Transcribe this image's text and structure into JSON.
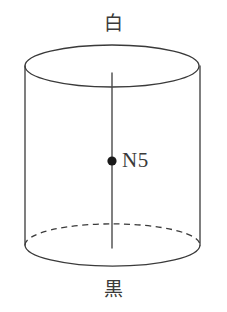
{
  "figure": {
    "background_color": "#ffffff",
    "stroke_color": "#3a3a3a",
    "width": 227,
    "height": 312
  },
  "labels": {
    "top": "白",
    "bottom": "黒",
    "center_point": "N5"
  },
  "geometry": {
    "top_ellipse": {
      "cx": 112,
      "cy": 66,
      "rx": 87,
      "ry": 21,
      "style": "solid"
    },
    "bottom_ellipse": {
      "cx": 112,
      "cy": 245,
      "rx": 87,
      "ry": 21,
      "front_style": "solid",
      "back_style": "dashed"
    },
    "left_side": {
      "x": 25,
      "y1": 66,
      "y2": 245
    },
    "right_side": {
      "x": 200,
      "y1": 66,
      "y2": 245
    },
    "axis_line": {
      "x": 112,
      "y1": 73,
      "y2": 248
    },
    "center_dot": {
      "cx": 112,
      "cy": 161,
      "r": 4.5,
      "fill": "#1a1a1a"
    }
  }
}
